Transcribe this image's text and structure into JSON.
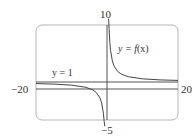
{
  "chart_data": {
    "type": "line",
    "title": "",
    "xlabel": "",
    "ylabel": "",
    "xlim": [
      -20,
      20
    ],
    "ylim": [
      -5,
      10
    ],
    "grid": false,
    "legend": null,
    "tick_labels": {
      "x_min": "−20",
      "x_max": "20",
      "y_max": "10",
      "y_min": "−5"
    },
    "series": [
      {
        "name": "y = f(x)",
        "description": "hyperbola with vertical asymptote x = 0 and horizontal asymptote y = 1",
        "branch_left": {
          "x": [
            -20,
            -15,
            -10,
            -6,
            -4,
            -3,
            -2,
            -1.5,
            -1,
            -0.8,
            -0.6
          ],
          "y": [
            0.75,
            0.67,
            0.5,
            0.17,
            -0.25,
            -0.67,
            -1.5,
            -2.33,
            -4.0,
            -5.25,
            -7.33
          ]
        },
        "branch_right": {
          "x": [
            0.45,
            0.6,
            0.8,
            1,
            1.5,
            2,
            3,
            4,
            6,
            10,
            15,
            20
          ],
          "y": [
            12.1,
            9.33,
            7.25,
            6.0,
            4.33,
            3.5,
            2.67,
            2.25,
            1.83,
            1.5,
            1.33,
            1.25
          ]
        }
      },
      {
        "name": "y = 1",
        "description": "horizontal asymptote",
        "x": [
          -20,
          20
        ],
        "y": [
          1,
          1
        ]
      }
    ],
    "annotations": [
      {
        "text": "y = f(x)",
        "x": 3.2,
        "y": 6.3
      },
      {
        "text": "y = 1",
        "x": -15,
        "y": 2.5
      }
    ]
  },
  "labels": {
    "x_min": "−20",
    "x_max": "20",
    "y_max": "10",
    "y_min": "−5",
    "curve_prefix": "y = ",
    "curve_func": "f",
    "curve_arg": "(x)",
    "asymptote": "y = 1"
  },
  "colors": {
    "frame": "#b5b5b5",
    "axes": "#555555",
    "curve": "#444444",
    "text": "#333333"
  }
}
